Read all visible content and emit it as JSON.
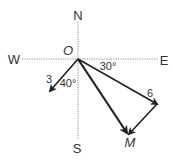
{
  "diagram": {
    "type": "vector-addition-compass",
    "compass": {
      "north": "N",
      "south": "S",
      "east": "E",
      "west": "W"
    },
    "origin_label": "O",
    "vectors": [
      {
        "name": "vector-3",
        "magnitude_label": "3",
        "angle_label": "40°",
        "direction": "40° west of south"
      },
      {
        "name": "vector-6",
        "magnitude_label": "6",
        "angle_label": "30°",
        "direction": "30° south of east"
      },
      {
        "name": "resultant",
        "end_label": "M",
        "from": "O",
        "to": "M"
      }
    ],
    "colors": {
      "stroke": "#222222",
      "axis": "#888888",
      "text": "#333333",
      "background": "#ffffff"
    }
  }
}
